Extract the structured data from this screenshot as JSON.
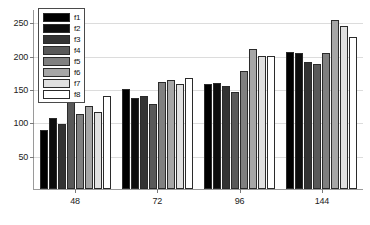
{
  "chart_data": {
    "type": "bar",
    "title": "",
    "xlabel": "",
    "ylabel": "",
    "categories": [
      "48",
      "72",
      "96",
      "144"
    ],
    "ylim": [
      0,
      270
    ],
    "yticks": [
      50,
      100,
      150,
      200,
      250
    ],
    "ytick_labels": [
      "50",
      "100",
      "150",
      "200",
      "250"
    ],
    "grid": true,
    "legend_position": "top-left",
    "series": [
      {
        "name": "f1",
        "color": "#000000",
        "values": [
          88,
          150,
          158,
          205
        ]
      },
      {
        "name": "f2",
        "color": "#0d0d0d",
        "values": [
          107,
          137,
          159,
          204
        ]
      },
      {
        "name": "f3",
        "color": "#333333",
        "values": [
          97,
          139,
          155,
          190
        ]
      },
      {
        "name": "f4",
        "color": "#595959",
        "values": [
          135,
          127,
          145,
          188
        ]
      },
      {
        "name": "f5",
        "color": "#808080",
        "values": [
          113,
          160,
          177,
          204
        ]
      },
      {
        "name": "f6",
        "color": "#a6a6a6",
        "values": [
          124,
          164,
          210,
          253
        ]
      },
      {
        "name": "f7",
        "color": "#e0e0e0",
        "values": [
          116,
          158,
          199,
          245
        ]
      },
      {
        "name": "f8",
        "color": "#ffffff",
        "values": [
          140,
          166,
          199,
          228
        ]
      }
    ]
  },
  "legend": {
    "entries": [
      {
        "label": "f1",
        "color": "#000000"
      },
      {
        "label": "f2",
        "color": "#0d0d0d"
      },
      {
        "label": "f3",
        "color": "#333333"
      },
      {
        "label": "f4",
        "color": "#595959"
      },
      {
        "label": "f5",
        "color": "#808080"
      },
      {
        "label": "f6",
        "color": "#a6a6a6"
      },
      {
        "label": "f7",
        "color": "#e0e0e0"
      },
      {
        "label": "f8",
        "color": "#ffffff"
      }
    ]
  },
  "axis_colors": {
    "axis_line": "#9a9a9a",
    "gridline": "#dcdcdc",
    "bar_outline": "#2b2b2b",
    "text": "#222222"
  }
}
